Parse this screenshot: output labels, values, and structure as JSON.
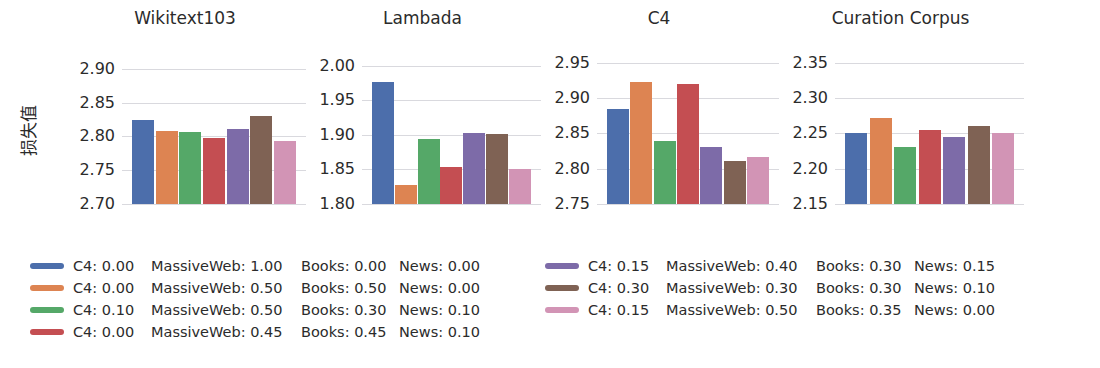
{
  "axis_label": "损失值",
  "legend_fields": {
    "c4": "C4",
    "massiveweb": "MassiveWeb",
    "books": "Books",
    "news": "News"
  },
  "series": [
    {
      "index": 0,
      "color": "#4c6eab",
      "c4": "C4: 0.00",
      "massiveweb": "MassiveWeb: 1.00",
      "books": "Books: 0.00",
      "news": "News: 0.00"
    },
    {
      "index": 1,
      "color": "#dd8452",
      "c4": "C4: 0.00",
      "massiveweb": "MassiveWeb: 0.50",
      "books": "Books: 0.50",
      "news": "News: 0.00"
    },
    {
      "index": 2,
      "color": "#55a868",
      "c4": "C4: 0.10",
      "massiveweb": "MassiveWeb: 0.50",
      "books": "Books: 0.30",
      "news": "News: 0.10"
    },
    {
      "index": 3,
      "color": "#c44e52",
      "c4": "C4: 0.00",
      "massiveweb": "MassiveWeb: 0.45",
      "books": "Books: 0.45",
      "news": "News: 0.10"
    },
    {
      "index": 4,
      "color": "#7d6ba8",
      "c4": "C4: 0.15",
      "massiveweb": "MassiveWeb: 0.40",
      "books": "Books: 0.30",
      "news": "News: 0.15"
    },
    {
      "index": 5,
      "color": "#7f6254",
      "c4": "C4: 0.30",
      "massiveweb": "MassiveWeb: 0.30",
      "books": "Books: 0.30",
      "news": "News: 0.10"
    },
    {
      "index": 6,
      "color": "#d височ"
    }
  ],
  "chart_data": [
    {
      "type": "bar",
      "title": "Wikitext103",
      "xlabel": "",
      "ylabel": "损失值",
      "ylim": [
        2.7,
        2.925
      ],
      "yticks": [
        2.7,
        2.75,
        2.8,
        2.85,
        2.9
      ],
      "ytick_labels": [
        "2.70",
        "2.75",
        "2.80",
        "2.85",
        "2.90"
      ],
      "grid": true,
      "legend_position": "below-figure",
      "categories": [
        "mix1",
        "mix2",
        "mix3",
        "mix4",
        "mix5",
        "mix6",
        "mix7"
      ],
      "values": [
        2.825,
        2.808,
        2.806,
        2.797,
        2.811,
        2.83,
        2.794
      ],
      "colors": [
        "#4c6eab",
        "#dd8452",
        "#55a868",
        "#c44e52",
        "#7d6ba8",
        "#7f6254",
        "#d294b5"
      ]
    },
    {
      "type": "bar",
      "title": "Lambada",
      "xlabel": "",
      "ylabel": "",
      "ylim": [
        1.8,
        2.02
      ],
      "yticks": [
        1.8,
        1.85,
        1.9,
        1.95,
        2.0
      ],
      "ytick_labels": [
        "1.80",
        "1.85",
        "1.90",
        "1.95",
        "2.00"
      ],
      "grid": true,
      "legend_position": "below-figure",
      "categories": [
        "mix1",
        "mix2",
        "mix3",
        "mix4",
        "mix5",
        "mix6",
        "mix7"
      ],
      "values": [
        1.977,
        1.828,
        1.894,
        1.853,
        1.903,
        1.901,
        1.851
      ],
      "colors": [
        "#4c6eab",
        "#dd8452",
        "#55a868",
        "#c44e52",
        "#7d6ba8",
        "#7f6254",
        "#d294b5"
      ]
    },
    {
      "type": "bar",
      "title": "C4",
      "xlabel": "",
      "ylabel": "",
      "ylim": [
        2.75,
        2.965
      ],
      "yticks": [
        2.75,
        2.8,
        2.85,
        2.9,
        2.95
      ],
      "ytick_labels": [
        "2.75",
        "2.80",
        "2.85",
        "2.90",
        "2.95"
      ],
      "grid": true,
      "legend_position": "below-figure",
      "categories": [
        "mix1",
        "mix2",
        "mix3",
        "mix4",
        "mix5",
        "mix6",
        "mix7"
      ],
      "values": [
        2.884,
        2.922,
        2.839,
        2.92,
        2.83,
        2.811,
        2.817
      ],
      "colors": [
        "#4c6eab",
        "#dd8452",
        "#55a868",
        "#c44e52",
        "#7d6ba8",
        "#7f6254",
        "#d294b5"
      ]
    },
    {
      "type": "bar",
      "title": "Curation Corpus",
      "xlabel": "",
      "ylabel": "",
      "ylim": [
        2.15,
        2.365
      ],
      "yticks": [
        2.15,
        2.2,
        2.25,
        2.3,
        2.35
      ],
      "ytick_labels": [
        "2.15",
        "2.20",
        "2.25",
        "2.30",
        "2.35"
      ],
      "grid": true,
      "legend_position": "below-figure",
      "categories": [
        "mix1",
        "mix2",
        "mix3",
        "mix4",
        "mix5",
        "mix6",
        "mix7"
      ],
      "values": [
        2.25,
        2.271,
        2.23,
        2.255,
        2.245,
        2.26,
        2.251
      ],
      "colors": [
        "#4c6eab",
        "#dd8452",
        "#55a868",
        "#c44e52",
        "#7d6ba8",
        "#7f6254",
        "#d294b5"
      ]
    }
  ],
  "legend": {
    "left_block": [
      {
        "color": "#4c6eab",
        "c4": "C4: 0.00",
        "massiveweb": "MassiveWeb: 1.00",
        "books": "Books: 0.00",
        "news": "News: 0.00"
      },
      {
        "color": "#dd8452",
        "c4": "C4: 0.00",
        "massiveweb": "MassiveWeb: 0.50",
        "books": "Books: 0.50",
        "news": "News: 0.00"
      },
      {
        "color": "#55a868",
        "c4": "C4: 0.10",
        "massiveweb": "MassiveWeb: 0.50",
        "books": "Books: 0.30",
        "news": "News: 0.10"
      },
      {
        "color": "#c44e52",
        "c4": "C4: 0.00",
        "massiveweb": "MassiveWeb: 0.45",
        "books": "Books: 0.45",
        "news": "News: 0.10"
      }
    ],
    "right_block": [
      {
        "color": "#7d6ba8",
        "c4": "C4: 0.15",
        "massiveweb": "MassiveWeb: 0.40",
        "books": "Books: 0.30",
        "news": "News: 0.15"
      },
      {
        "color": "#7f6254",
        "c4": "C4: 0.30",
        "massiveweb": "MassiveWeb: 0.30",
        "books": "Books: 0.30",
        "news": "News: 0.10"
      },
      {
        "color": "#d294b5",
        "c4": "C4: 0.15",
        "massiveweb": "MassiveWeb: 0.50",
        "books": "Books: 0.35",
        "news": "News: 0.00"
      }
    ]
  }
}
